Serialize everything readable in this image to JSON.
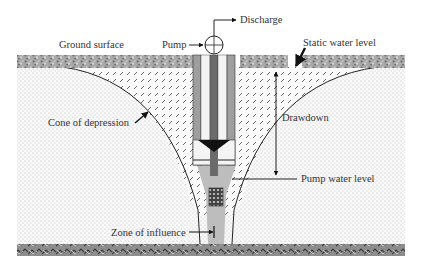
{
  "labels": {
    "discharge": "Discharge",
    "pump": "Pump",
    "ground_surface": "Ground surface",
    "static_water_level": "Static water level",
    "cone_of_depression": "Cone of depression",
    "drawdown": "Drawdown",
    "pump_water_level": "Pump water level",
    "zone_of_influence": "Zone of influence"
  },
  "colors": {
    "background": "#ffffff",
    "ground_texture": "#9a9a9a",
    "bedrock_texture": "#7a7a7a",
    "casing": "#9e9e9e",
    "casing_dark": "#6b6b6b",
    "inner_pipe": "#555555",
    "water_in_well": "#bdbdbd",
    "line": "#222222",
    "text": "#333333"
  }
}
